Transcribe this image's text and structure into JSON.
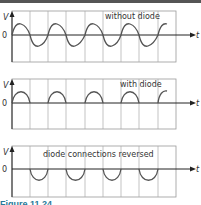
{
  "figure": {
    "caption": "Figure 11.24",
    "panels": [
      {
        "title": "without diode",
        "y_axis": "V",
        "x_axis": "t",
        "origin": "0",
        "waveform": "full sine"
      },
      {
        "title": "with diode",
        "y_axis": "V",
        "x_axis": "t",
        "origin": "0",
        "waveform": "positive half-wave"
      },
      {
        "title": "diode connections reversed",
        "y_axis": "V",
        "x_axis": "t",
        "origin": "0",
        "waveform": "negative half-wave"
      }
    ],
    "colors": {
      "grid": "#999999",
      "wave": "#555555",
      "axis": "#222222"
    }
  }
}
